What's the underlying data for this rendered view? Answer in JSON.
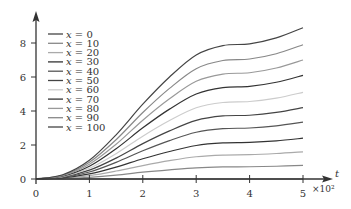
{
  "chart_data": {
    "type": "line",
    "title": "",
    "xlabel": "t",
    "x_multiplier": "×10²",
    "ylabel": "",
    "xlim": [
      0,
      5
    ],
    "ylim": [
      0,
      9.5
    ],
    "x_ticks": [
      0,
      1,
      2,
      3,
      4,
      5
    ],
    "y_ticks": [
      0,
      2,
      4,
      6,
      8
    ],
    "grid": false,
    "legend_position": "upper-left",
    "x": [
      0,
      0.5,
      1,
      1.5,
      2,
      2.5,
      3,
      3.5,
      4,
      4.5,
      5
    ],
    "series": [
      {
        "name": "x = 0",
        "color": "#444444",
        "values": [
          0,
          0,
          0,
          0,
          0,
          0,
          0,
          0,
          0,
          0,
          0
        ]
      },
      {
        "name": "x = 10",
        "color": "#888888",
        "values": [
          0,
          0.02,
          0.1,
          0.23,
          0.4,
          0.54,
          0.66,
          0.71,
          0.72,
          0.75,
          0.8
        ]
      },
      {
        "name": "x = 20",
        "color": "#aaaaaa",
        "values": [
          0,
          0.04,
          0.2,
          0.47,
          0.79,
          1.08,
          1.31,
          1.41,
          1.43,
          1.5,
          1.6
        ]
      },
      {
        "name": "x = 30",
        "color": "#333333",
        "values": [
          0,
          0.07,
          0.3,
          0.7,
          1.19,
          1.62,
          1.97,
          2.12,
          2.15,
          2.24,
          2.4
        ]
      },
      {
        "name": "x = 40",
        "color": "#555555",
        "values": [
          0,
          0.09,
          0.41,
          0.98,
          1.66,
          2.26,
          2.75,
          2.96,
          3.0,
          3.13,
          3.35
        ]
      },
      {
        "name": "x = 50",
        "color": "#444444",
        "values": [
          0,
          0.12,
          0.52,
          1.23,
          2.08,
          2.83,
          3.45,
          3.71,
          3.75,
          3.92,
          4.2
        ]
      },
      {
        "name": "x = 60",
        "color": "#cccccc",
        "values": [
          0,
          0.14,
          0.63,
          1.49,
          2.52,
          3.44,
          4.19,
          4.5,
          4.56,
          4.76,
          5.1
        ]
      },
      {
        "name": "x = 70",
        "color": "#333333",
        "values": [
          0,
          0.17,
          0.75,
          1.78,
          3.01,
          4.11,
          5.0,
          5.38,
          5.45,
          5.69,
          6.1
        ]
      },
      {
        "name": "x = 80",
        "color": "#999999",
        "values": [
          0,
          0.2,
          0.87,
          2.04,
          3.46,
          4.72,
          5.75,
          6.17,
          6.25,
          6.53,
          7.0
        ]
      },
      {
        "name": "x = 90",
        "color": "#888888",
        "values": [
          0,
          0.22,
          0.98,
          2.31,
          3.91,
          5.33,
          6.49,
          6.97,
          7.06,
          7.37,
          7.9
        ]
      },
      {
        "name": "x = 100",
        "color": "#444444",
        "values": [
          0,
          0.25,
          1.1,
          2.6,
          4.4,
          6.0,
          7.3,
          7.85,
          7.95,
          8.3,
          8.9
        ]
      }
    ]
  },
  "axes": {
    "x_label": "t",
    "x_multiplier": "×10²",
    "x_tick_labels": [
      "0",
      "1",
      "2",
      "3",
      "4",
      "5"
    ],
    "y_tick_labels": [
      "0",
      "2",
      "4",
      "6",
      "8"
    ]
  }
}
